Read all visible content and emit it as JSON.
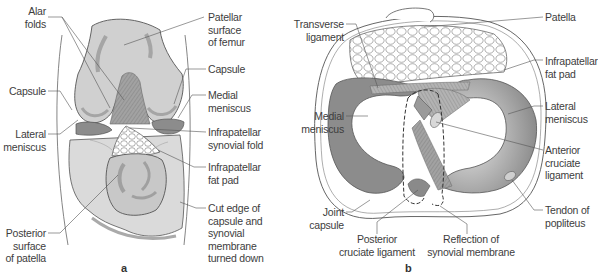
{
  "figure": {
    "panels": [
      {
        "id": "a",
        "label": "a",
        "labels_left": {
          "alar_folds": [
            "Alar",
            "folds"
          ],
          "capsule": [
            "Capsule"
          ],
          "lateral_meniscus": [
            "Lateral",
            "meniscus"
          ],
          "posterior_surface_of_patella": [
            "Posterior",
            "surface",
            "of patella"
          ]
        },
        "labels_right": {
          "patellar_surface_of_femur": [
            "Patellar",
            "surface",
            "of femur"
          ],
          "capsule": [
            "Capsule"
          ],
          "medial_meniscus": [
            "Medial",
            "meniscus"
          ],
          "infrapatellar_synovial_fold": [
            "Infrapatellar",
            "synovial fold"
          ],
          "infrapatellar_fat_pad": [
            "Infrapatellar",
            "fat pad"
          ],
          "cut_edge": [
            "Cut edge of",
            "capsule and",
            "synovial",
            "membrane",
            "turned down"
          ]
        }
      },
      {
        "id": "b",
        "label": "b",
        "labels_left": {
          "transverse_ligament": [
            "Transverse",
            "ligament"
          ],
          "medial_meniscus": [
            "Medial",
            "meniscus"
          ],
          "joint_capsule": [
            "Joint",
            "capsule"
          ]
        },
        "labels_bottom": {
          "posterior_cruciate_ligament": [
            "Posterior",
            "cruciate ligament"
          ],
          "reflection_of_synovial_membrane": [
            "Reflection of",
            "synovial membrane"
          ]
        },
        "labels_right": {
          "patella": [
            "Patella"
          ],
          "infrapatellar_fat_pad": [
            "Infrapatellar",
            "fat pad"
          ],
          "lateral_meniscus": [
            "Lateral",
            "meniscus"
          ],
          "anterior_cruciate_ligament": [
            "Anterior",
            "cruciate",
            "ligament"
          ],
          "tendon_of_popliteus": [
            "Tendon of",
            "popliteus"
          ]
        }
      }
    ],
    "colors": {
      "bone": "#d4d4d4",
      "bone_shade": "#a9a9a9",
      "meniscus": "#8c8c8c",
      "ligament": "#9a9a9a",
      "fat": "#ffffff",
      "line": "#555555"
    }
  }
}
